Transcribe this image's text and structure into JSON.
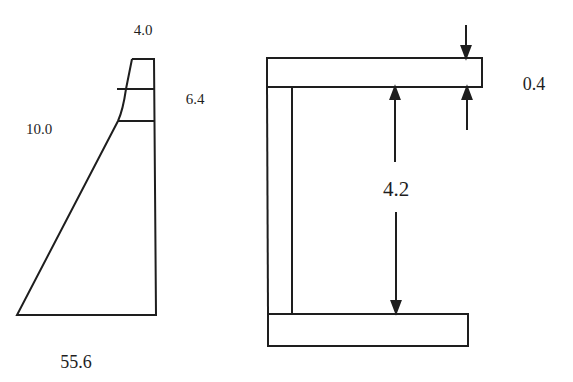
{
  "diagram": {
    "left_section": {
      "name": "tapered wall section",
      "labels": {
        "top_width": "4.0",
        "upper_height": "6.4",
        "mid_height": "10.0",
        "base_width": "55.6"
      }
    },
    "right_section": {
      "name": "channel section",
      "labels": {
        "flange_thickness": "0.4",
        "clear_height": "4.2"
      }
    },
    "colors": {
      "stroke": "#1e1e1e",
      "background": "#ffffff"
    }
  }
}
